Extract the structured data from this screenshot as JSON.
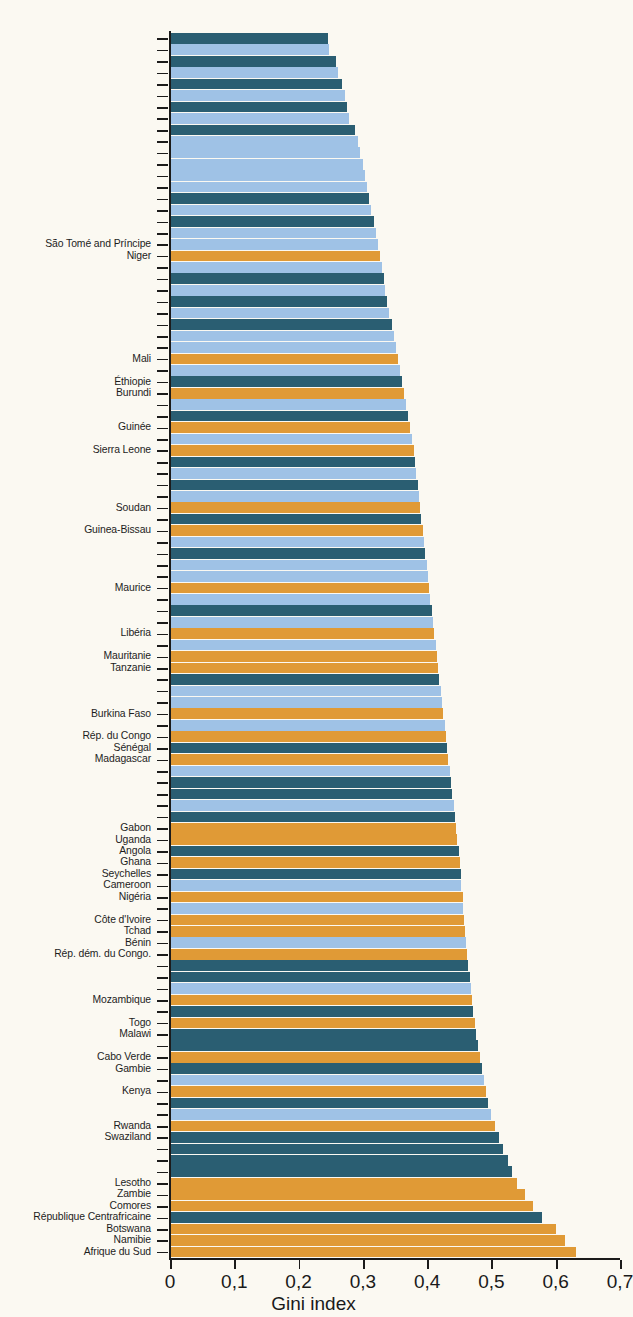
{
  "chart_data": {
    "type": "bar",
    "orientation": "horizontal",
    "title": "",
    "xlabel": "Gini index",
    "ylabel": "",
    "xlim": [
      0,
      0.7
    ],
    "xticks": [
      0,
      0.1,
      0.2,
      0.3,
      0.4,
      0.5,
      0.6,
      0.7
    ],
    "xtick_labels": [
      "0",
      "0,1",
      "0,2",
      "0,3",
      "0,4",
      "0,5",
      "0,6",
      "0,7"
    ],
    "grid": false,
    "legend": null,
    "colors": {
      "light_blue": "#9FC2E6",
      "dark_teal": "#2A5E72",
      "orange": "#E09A36",
      "background": "#FBF9F2",
      "axis": "#1b1b1b",
      "text": "#1d1d1d"
    },
    "note": "Bars sorted ascending by Gini index from top to bottom; only a subset of categories carry visible tick labels.",
    "bars": [
      {
        "label": "",
        "value": 0.246,
        "color": "dark_teal"
      },
      {
        "label": "",
        "value": 0.248,
        "color": "light_blue"
      },
      {
        "label": "",
        "value": 0.258,
        "color": "dark_teal"
      },
      {
        "label": "",
        "value": 0.262,
        "color": "light_blue"
      },
      {
        "label": "",
        "value": 0.268,
        "color": "dark_teal"
      },
      {
        "label": "",
        "value": 0.272,
        "color": "light_blue"
      },
      {
        "label": "",
        "value": 0.275,
        "color": "dark_teal"
      },
      {
        "label": "",
        "value": 0.278,
        "color": "light_blue"
      },
      {
        "label": "",
        "value": 0.288,
        "color": "dark_teal"
      },
      {
        "label": "",
        "value": 0.292,
        "color": "light_blue"
      },
      {
        "label": "",
        "value": 0.296,
        "color": "light_blue"
      },
      {
        "label": "",
        "value": 0.3,
        "color": "light_blue"
      },
      {
        "label": "",
        "value": 0.303,
        "color": "light_blue"
      },
      {
        "label": "",
        "value": 0.306,
        "color": "light_blue"
      },
      {
        "label": "",
        "value": 0.31,
        "color": "dark_teal"
      },
      {
        "label": "",
        "value": 0.313,
        "color": "light_blue"
      },
      {
        "label": "",
        "value": 0.318,
        "color": "dark_teal"
      },
      {
        "label": "",
        "value": 0.32,
        "color": "light_blue"
      },
      {
        "label": "São Tomé and Príncipe",
        "value": 0.324,
        "color": "light_blue"
      },
      {
        "label": "Niger",
        "value": 0.327,
        "color": "orange"
      },
      {
        "label": "",
        "value": 0.33,
        "color": "light_blue"
      },
      {
        "label": "",
        "value": 0.333,
        "color": "dark_teal"
      },
      {
        "label": "",
        "value": 0.335,
        "color": "light_blue"
      },
      {
        "label": "",
        "value": 0.338,
        "color": "dark_teal"
      },
      {
        "label": "",
        "value": 0.341,
        "color": "light_blue"
      },
      {
        "label": "",
        "value": 0.345,
        "color": "dark_teal"
      },
      {
        "label": "",
        "value": 0.348,
        "color": "light_blue"
      },
      {
        "label": "",
        "value": 0.352,
        "color": "light_blue"
      },
      {
        "label": "Mali",
        "value": 0.355,
        "color": "orange"
      },
      {
        "label": "",
        "value": 0.358,
        "color": "light_blue"
      },
      {
        "label": "Éthiopie",
        "value": 0.361,
        "color": "dark_teal"
      },
      {
        "label": "Burundi",
        "value": 0.364,
        "color": "orange"
      },
      {
        "label": "",
        "value": 0.367,
        "color": "light_blue"
      },
      {
        "label": "",
        "value": 0.37,
        "color": "dark_teal"
      },
      {
        "label": "Guinée",
        "value": 0.373,
        "color": "orange"
      },
      {
        "label": "",
        "value": 0.376,
        "color": "light_blue"
      },
      {
        "label": "Sierra Leone",
        "value": 0.379,
        "color": "orange"
      },
      {
        "label": "",
        "value": 0.381,
        "color": "dark_teal"
      },
      {
        "label": "",
        "value": 0.383,
        "color": "light_blue"
      },
      {
        "label": "",
        "value": 0.385,
        "color": "dark_teal"
      },
      {
        "label": "",
        "value": 0.387,
        "color": "light_blue"
      },
      {
        "label": "Soudan",
        "value": 0.389,
        "color": "orange"
      },
      {
        "label": "",
        "value": 0.391,
        "color": "dark_teal"
      },
      {
        "label": "Guinea-Bissau",
        "value": 0.393,
        "color": "orange"
      },
      {
        "label": "",
        "value": 0.395,
        "color": "light_blue"
      },
      {
        "label": "",
        "value": 0.397,
        "color": "dark_teal"
      },
      {
        "label": "",
        "value": 0.399,
        "color": "light_blue"
      },
      {
        "label": "",
        "value": 0.401,
        "color": "light_blue"
      },
      {
        "label": "Maurice",
        "value": 0.403,
        "color": "orange"
      },
      {
        "label": "",
        "value": 0.405,
        "color": "light_blue"
      },
      {
        "label": "",
        "value": 0.407,
        "color": "dark_teal"
      },
      {
        "label": "",
        "value": 0.409,
        "color": "light_blue"
      },
      {
        "label": "Libéria",
        "value": 0.411,
        "color": "orange"
      },
      {
        "label": "",
        "value": 0.413,
        "color": "light_blue"
      },
      {
        "label": "Mauritanie",
        "value": 0.415,
        "color": "orange"
      },
      {
        "label": "Tanzanie",
        "value": 0.417,
        "color": "orange"
      },
      {
        "label": "",
        "value": 0.419,
        "color": "dark_teal"
      },
      {
        "label": "",
        "value": 0.421,
        "color": "light_blue"
      },
      {
        "label": "",
        "value": 0.423,
        "color": "light_blue"
      },
      {
        "label": "Burkina Faso",
        "value": 0.425,
        "color": "orange"
      },
      {
        "label": "",
        "value": 0.427,
        "color": "light_blue"
      },
      {
        "label": "Rép. du Congo",
        "value": 0.429,
        "color": "orange"
      },
      {
        "label": "Sénégal",
        "value": 0.431,
        "color": "dark_teal"
      },
      {
        "label": "Madagascar",
        "value": 0.433,
        "color": "orange"
      },
      {
        "label": "",
        "value": 0.435,
        "color": "light_blue"
      },
      {
        "label": "",
        "value": 0.437,
        "color": "dark_teal"
      },
      {
        "label": "",
        "value": 0.439,
        "color": "dark_teal"
      },
      {
        "label": "",
        "value": 0.441,
        "color": "light_blue"
      },
      {
        "label": "",
        "value": 0.443,
        "color": "dark_teal"
      },
      {
        "label": "Gabon",
        "value": 0.445,
        "color": "orange"
      },
      {
        "label": "Uganda",
        "value": 0.447,
        "color": "orange"
      },
      {
        "label": "Angola",
        "value": 0.449,
        "color": "dark_teal"
      },
      {
        "label": "Ghana",
        "value": 0.451,
        "color": "orange"
      },
      {
        "label": "Seychelles",
        "value": 0.452,
        "color": "dark_teal"
      },
      {
        "label": "Cameroon",
        "value": 0.453,
        "color": "light_blue"
      },
      {
        "label": "Nigéria",
        "value": 0.455,
        "color": "orange"
      },
      {
        "label": "",
        "value": 0.456,
        "color": "light_blue"
      },
      {
        "label": "Côte d'Ivoire",
        "value": 0.457,
        "color": "orange"
      },
      {
        "label": "Tchad",
        "value": 0.459,
        "color": "orange"
      },
      {
        "label": "Bénin",
        "value": 0.46,
        "color": "light_blue"
      },
      {
        "label": "Rép. dém. du Congo.",
        "value": 0.462,
        "color": "orange"
      },
      {
        "label": "",
        "value": 0.464,
        "color": "dark_teal"
      },
      {
        "label": "",
        "value": 0.466,
        "color": "dark_teal"
      },
      {
        "label": "",
        "value": 0.468,
        "color": "light_blue"
      },
      {
        "label": "Mozambique",
        "value": 0.47,
        "color": "orange"
      },
      {
        "label": "",
        "value": 0.472,
        "color": "dark_teal"
      },
      {
        "label": "Togo",
        "value": 0.474,
        "color": "orange"
      },
      {
        "label": "Malawi",
        "value": 0.476,
        "color": "dark_teal"
      },
      {
        "label": "",
        "value": 0.479,
        "color": "dark_teal"
      },
      {
        "label": "Cabo Verde",
        "value": 0.482,
        "color": "orange"
      },
      {
        "label": "Gambie",
        "value": 0.485,
        "color": "dark_teal"
      },
      {
        "label": "",
        "value": 0.489,
        "color": "light_blue"
      },
      {
        "label": "Kenya",
        "value": 0.492,
        "color": "orange"
      },
      {
        "label": "",
        "value": 0.495,
        "color": "dark_teal"
      },
      {
        "label": "",
        "value": 0.5,
        "color": "light_blue"
      },
      {
        "label": "Rwanda",
        "value": 0.505,
        "color": "orange"
      },
      {
        "label": "Swaziland",
        "value": 0.512,
        "color": "dark_teal"
      },
      {
        "label": "",
        "value": 0.518,
        "color": "dark_teal"
      },
      {
        "label": "",
        "value": 0.525,
        "color": "dark_teal"
      },
      {
        "label": "",
        "value": 0.532,
        "color": "dark_teal"
      },
      {
        "label": "Lesotho",
        "value": 0.54,
        "color": "orange"
      },
      {
        "label": "Zambie",
        "value": 0.552,
        "color": "orange"
      },
      {
        "label": "Comores",
        "value": 0.565,
        "color": "orange"
      },
      {
        "label": "République Centrafricaine",
        "value": 0.578,
        "color": "dark_teal"
      },
      {
        "label": "Botswana",
        "value": 0.6,
        "color": "orange"
      },
      {
        "label": "Namibie",
        "value": 0.614,
        "color": "orange"
      },
      {
        "label": "Afrique du Sud",
        "value": 0.632,
        "color": "orange"
      }
    ]
  }
}
